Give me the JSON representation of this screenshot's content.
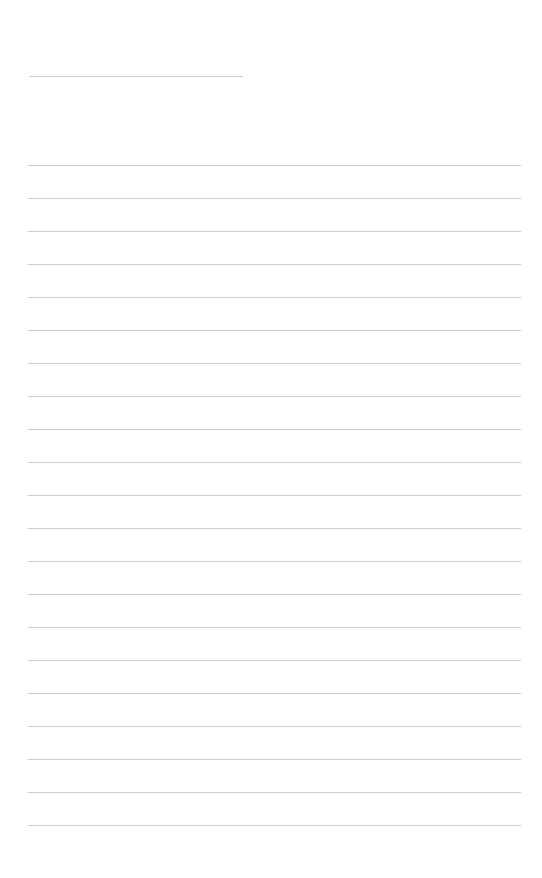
{
  "page": {
    "type": "lined-paper",
    "background": "#ffffff",
    "line_color": "#cbcbcb",
    "header_line": {
      "x": 30,
      "y": 76,
      "width": 213
    },
    "rules": {
      "count": 21,
      "start_y": 165,
      "spacing": 33,
      "x": 28,
      "width": 493
    }
  }
}
